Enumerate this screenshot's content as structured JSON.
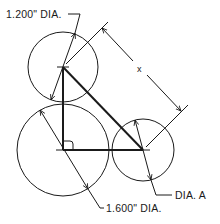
{
  "diagram": {
    "title": "",
    "labels": {
      "top_circle": "1.200\" DIA.",
      "bottom_circle": "1.600\" DIA.",
      "right_circle": "DIA. A",
      "dimension_x": "x"
    },
    "colors": {
      "stroke": "#1a1a1a",
      "background": "#ffffff"
    },
    "circles": [
      {
        "id": "top",
        "diameter_label": "1.200\" DIA.",
        "cx": 63,
        "cy": 67,
        "r": 35
      },
      {
        "id": "bottom-left",
        "diameter_label": "1.600\" DIA.",
        "cx": 63,
        "cy": 150,
        "r": 46
      },
      {
        "id": "right",
        "diameter_label": "DIA. A",
        "cx": 143,
        "cy": 150,
        "r": 31
      }
    ],
    "triangle": {
      "vertices": [
        [
          63,
          67
        ],
        [
          63,
          150
        ],
        [
          143,
          150
        ]
      ],
      "right_angle_at": [
        63,
        150
      ]
    }
  }
}
